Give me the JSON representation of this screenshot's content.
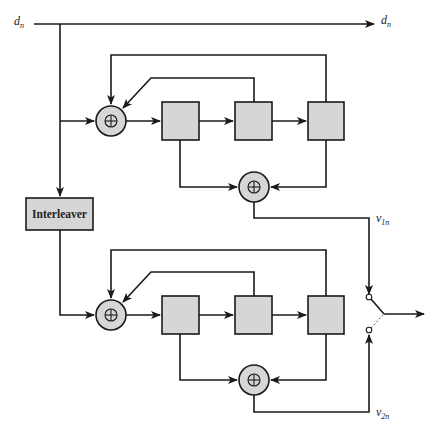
{
  "diagram": {
    "type": "turbo-encoder-block-diagram",
    "input_label": {
      "base": "d",
      "sub": "n"
    },
    "systematic_output_label": {
      "base": "d",
      "sub": "n"
    },
    "interleaver_label": "Interleaver",
    "encoder1_output_label": {
      "base": "v",
      "sub": "1n"
    },
    "encoder2_output_label": {
      "base": "v",
      "sub": "2n"
    },
    "xor_symbol": "⊕",
    "encoders": [
      {
        "name": "rsc-encoder-1",
        "registers": 3,
        "adders": 2
      },
      {
        "name": "rsc-encoder-2",
        "registers": 3,
        "adders": 2
      }
    ],
    "colors": {
      "block_fill": "#d6d6d6",
      "line": "#1a1a1a",
      "background": "#ffffff"
    }
  }
}
